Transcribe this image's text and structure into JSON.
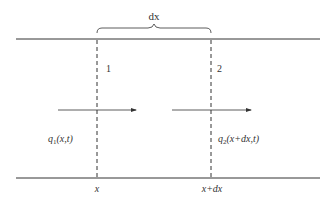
{
  "diagram": {
    "brace_label": "dx",
    "section_labels": [
      "1",
      "2"
    ],
    "flow_labels": {
      "q1": {
        "var": "q",
        "sub": "1",
        "args": "(x,t)"
      },
      "q2": {
        "var": "q",
        "sub": "2",
        "args": "(x+dx,t)"
      }
    },
    "position_labels": [
      "x",
      "x+dx"
    ],
    "colors": {
      "line": "#333333",
      "background": "#ffffff"
    }
  }
}
